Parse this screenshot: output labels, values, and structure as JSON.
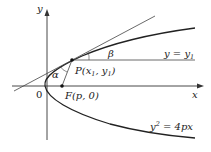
{
  "diagram": {
    "axes": {
      "x_label": "x",
      "y_label": "y",
      "origin_label": "0"
    },
    "curve": {
      "equation": "y² = 4px",
      "eq_parts": {
        "y": "y",
        "exp": "2",
        "rest": " = 4px"
      }
    },
    "point_P": {
      "label": "P",
      "coords": "(x",
      "sub1": "1",
      "mid": ", y",
      "sub2": "1",
      "end": ")"
    },
    "point_F": {
      "label": "F",
      "coords": "(p, 0)"
    },
    "horizontal_line": {
      "label_y": "y = y",
      "label_sub": "1"
    },
    "angles": {
      "alpha": "α",
      "beta": "β"
    },
    "colors": {
      "line": "#333333",
      "text": "#222222",
      "background": "#ffffff"
    }
  }
}
